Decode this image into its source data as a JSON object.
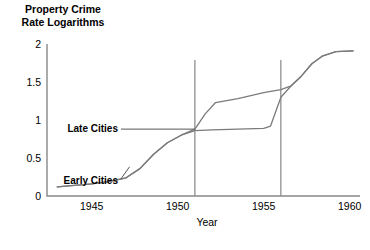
{
  "chart_data": {
    "type": "line",
    "title": "Property Crime Rate Logarithms",
    "title_line1": "Property Crime",
    "title_line2": "Rate Logarithms",
    "xlabel": "Year",
    "ylabel": "Property Crime Rate Logarithms",
    "xlim": [
      1942.4,
      1960.6
    ],
    "ylim": [
      0,
      2
    ],
    "xticks": [
      1945,
      1950,
      1955,
      1960
    ],
    "xtick_labels": [
      "1945",
      "1950",
      "1955",
      "1960"
    ],
    "yticks": [
      0,
      0.5,
      1,
      1.5,
      2
    ],
    "ytick_labels": [
      "0",
      "0.5",
      "1",
      "1.5",
      "2"
    ],
    "grid": false,
    "legend": "inline-annotations",
    "annotations": [
      {
        "text": "Late Cities",
        "x": 1951.0,
        "y": 0.88,
        "leader": "horizontal"
      },
      {
        "text": "Early Cities",
        "x": 1947.2,
        "y": 0.2,
        "leader": "diagonal"
      }
    ],
    "reference_lines": [
      {
        "x": 1951.0,
        "orientation": "vertical"
      },
      {
        "x": 1956.0,
        "orientation": "vertical"
      }
    ],
    "series": [
      {
        "name": "Early Cities",
        "x": [
          1943.0,
          1944.0,
          1945.0,
          1946.0,
          1947.0,
          1947.8,
          1948.6,
          1949.4,
          1950.2,
          1951.0,
          1951.6,
          1952.2,
          1953.5,
          1955.0,
          1956.0,
          1956.6,
          1957.2,
          1957.8,
          1958.4,
          1959.2,
          1960.2
        ],
        "values": [
          0.12,
          0.14,
          0.16,
          0.19,
          0.24,
          0.36,
          0.55,
          0.7,
          0.8,
          0.88,
          1.08,
          1.23,
          1.28,
          1.36,
          1.4,
          1.45,
          1.58,
          1.74,
          1.84,
          1.9,
          1.91
        ]
      },
      {
        "name": "Late Cities",
        "x": [
          1943.0,
          1944.0,
          1945.0,
          1946.0,
          1947.0,
          1947.8,
          1948.6,
          1949.4,
          1950.2,
          1951.0,
          1952.0,
          1953.5,
          1955.0,
          1955.4,
          1956.0,
          1956.6,
          1957.2,
          1957.8,
          1958.4,
          1959.2,
          1960.2
        ],
        "values": [
          0.12,
          0.14,
          0.16,
          0.19,
          0.24,
          0.36,
          0.55,
          0.7,
          0.8,
          0.86,
          0.87,
          0.88,
          0.89,
          0.92,
          1.3,
          1.45,
          1.58,
          1.74,
          1.84,
          1.9,
          1.91
        ]
      }
    ]
  }
}
